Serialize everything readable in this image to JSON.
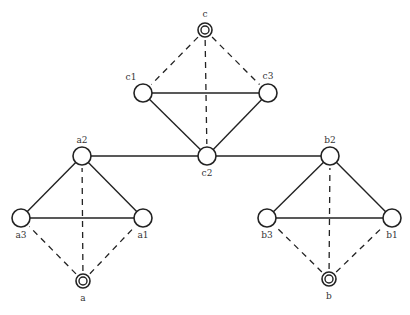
{
  "diagram": {
    "title": "",
    "colors": {
      "stroke": "#222222",
      "fill": "#ffffff",
      "label": "#333333"
    },
    "nodes": [
      {
        "id": "c",
        "label": "c",
        "x": 205,
        "y": 30,
        "kind": "double",
        "label_dx": 0,
        "label_dy": -13
      },
      {
        "id": "c1",
        "label": "c1",
        "x": 143,
        "y": 93,
        "kind": "single",
        "label_dx": -12,
        "label_dy": -13
      },
      {
        "id": "c3",
        "label": "c3",
        "x": 268,
        "y": 93,
        "kind": "single",
        "label_dx": 0,
        "label_dy": -14
      },
      {
        "id": "c2",
        "label": "c2",
        "x": 207,
        "y": 156,
        "kind": "single",
        "label_dx": 0,
        "label_dy": 20
      },
      {
        "id": "a2",
        "label": "a2",
        "x": 82,
        "y": 156,
        "kind": "single",
        "label_dx": 0,
        "label_dy": -13
      },
      {
        "id": "a3",
        "label": "a3",
        "x": 21,
        "y": 218,
        "kind": "single",
        "label_dx": 0,
        "label_dy": 20
      },
      {
        "id": "a1",
        "label": "a1",
        "x": 143,
        "y": 218,
        "kind": "single",
        "label_dx": 0,
        "label_dy": 20
      },
      {
        "id": "a",
        "label": "a",
        "x": 83,
        "y": 281,
        "kind": "double",
        "label_dx": 0,
        "label_dy": 20
      },
      {
        "id": "b2",
        "label": "b2",
        "x": 330,
        "y": 156,
        "kind": "single",
        "label_dx": 0,
        "label_dy": -13
      },
      {
        "id": "b3",
        "label": "b3",
        "x": 267,
        "y": 218,
        "kind": "single",
        "label_dx": 0,
        "label_dy": 20
      },
      {
        "id": "b1",
        "label": "b1",
        "x": 392,
        "y": 218,
        "kind": "single",
        "label_dx": 0,
        "label_dy": 20
      },
      {
        "id": "b",
        "label": "b",
        "x": 329,
        "y": 279,
        "kind": "double",
        "label_dx": 0,
        "label_dy": 20
      }
    ],
    "edges": [
      {
        "from": "c1",
        "to": "c3",
        "style": "solid"
      },
      {
        "from": "c1",
        "to": "c2",
        "style": "solid"
      },
      {
        "from": "c3",
        "to": "c2",
        "style": "solid"
      },
      {
        "from": "c",
        "to": "c1",
        "style": "dashed"
      },
      {
        "from": "c",
        "to": "c3",
        "style": "dashed"
      },
      {
        "from": "c",
        "to": "c2",
        "style": "dashed"
      },
      {
        "from": "a2",
        "to": "c2",
        "style": "solid"
      },
      {
        "from": "c2",
        "to": "b2",
        "style": "solid"
      },
      {
        "from": "a2",
        "to": "a3",
        "style": "solid"
      },
      {
        "from": "a2",
        "to": "a1",
        "style": "solid"
      },
      {
        "from": "a3",
        "to": "a1",
        "style": "solid"
      },
      {
        "from": "a",
        "to": "a3",
        "style": "dashed"
      },
      {
        "from": "a",
        "to": "a1",
        "style": "dashed"
      },
      {
        "from": "a",
        "to": "a2",
        "style": "dashed"
      },
      {
        "from": "b2",
        "to": "b3",
        "style": "solid"
      },
      {
        "from": "b2",
        "to": "b1",
        "style": "solid"
      },
      {
        "from": "b3",
        "to": "b1",
        "style": "solid"
      },
      {
        "from": "b",
        "to": "b3",
        "style": "dashed"
      },
      {
        "from": "b",
        "to": "b1",
        "style": "dashed"
      },
      {
        "from": "b",
        "to": "b2",
        "style": "dashed"
      }
    ]
  }
}
